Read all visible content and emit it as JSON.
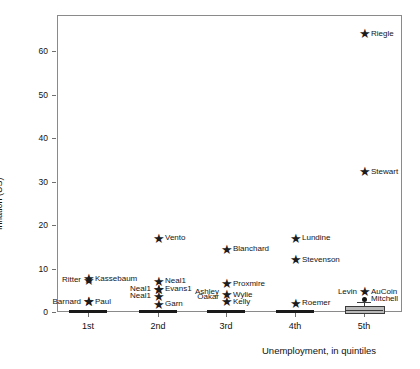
{
  "chart_data": {
    "type": "scatter",
    "title": "",
    "xlabel": "Unemployment, in quintiles",
    "ylabel": "Inflation (US)",
    "categories": [
      "1st",
      "2nd",
      "3rd",
      "4th",
      "5th"
    ],
    "yticks": [
      0,
      10,
      20,
      30,
      40,
      50,
      60
    ],
    "ylim": [
      0,
      68
    ],
    "grid": false,
    "legend": null,
    "points": [
      {
        "label": "Barnard",
        "quintile": "1st",
        "x": 1,
        "y": 2.4,
        "side": "left",
        "marker": "star"
      },
      {
        "label": "Paul",
        "quintile": "1st",
        "x": 1,
        "y": 2.4,
        "side": "right",
        "marker": "star"
      },
      {
        "label": "Ritter",
        "quintile": "1st",
        "x": 1,
        "y": 7.3,
        "side": "left",
        "marker": "star"
      },
      {
        "label": "Kassebaum",
        "quintile": "1st",
        "x": 1,
        "y": 7.6,
        "side": "right",
        "marker": "star"
      },
      {
        "label": "Vento",
        "quintile": "2nd",
        "x": 2,
        "y": 17.0,
        "side": "right",
        "marker": "star"
      },
      {
        "label": "Neal1",
        "quintile": "2nd",
        "x": 2,
        "y": 7.1,
        "side": "right",
        "marker": "star"
      },
      {
        "label": "Neal1",
        "quintile": "2nd",
        "x": 2,
        "y": 5.2,
        "side": "left",
        "marker": "star"
      },
      {
        "label": "Evans1",
        "quintile": "2nd",
        "x": 2,
        "y": 5.2,
        "side": "right",
        "marker": "star"
      },
      {
        "label": "Neal1",
        "quintile": "2nd",
        "x": 2,
        "y": 3.6,
        "side": "left",
        "marker": "star"
      },
      {
        "label": "Garn",
        "quintile": "2nd",
        "x": 2,
        "y": 1.8,
        "side": "right",
        "marker": "star"
      },
      {
        "label": "Blanchard",
        "quintile": "3rd",
        "x": 3,
        "y": 14.4,
        "side": "right",
        "marker": "star"
      },
      {
        "label": "Proxmire",
        "quintile": "3rd",
        "x": 3,
        "y": 6.5,
        "side": "right",
        "marker": "star"
      },
      {
        "label": "Ashley",
        "quintile": "3rd",
        "x": 3,
        "y": 4.6,
        "side": "left",
        "marker": "none"
      },
      {
        "label": "Oakar",
        "quintile": "3rd",
        "x": 3,
        "y": 3.4,
        "side": "left",
        "marker": "none"
      },
      {
        "label": "Wylie",
        "quintile": "3rd",
        "x": 3,
        "y": 4.0,
        "side": "right",
        "marker": "star"
      },
      {
        "label": "Kelly",
        "quintile": "3rd",
        "x": 3,
        "y": 2.3,
        "side": "right",
        "marker": "star"
      },
      {
        "label": "Lundine",
        "quintile": "4th",
        "x": 4,
        "y": 17.0,
        "side": "right",
        "marker": "star"
      },
      {
        "label": "Stevenson",
        "quintile": "4th",
        "x": 4,
        "y": 12.0,
        "side": "right",
        "marker": "star"
      },
      {
        "label": "Roemer",
        "quintile": "4th",
        "x": 4,
        "y": 2.0,
        "side": "right",
        "marker": "star"
      },
      {
        "label": "Riegle",
        "quintile": "5th",
        "x": 5,
        "y": 64.0,
        "side": "right",
        "marker": "star"
      },
      {
        "label": "Stewart",
        "quintile": "5th",
        "x": 5,
        "y": 32.2,
        "side": "right",
        "marker": "star"
      },
      {
        "label": "Levin",
        "quintile": "5th",
        "x": 5,
        "y": 4.6,
        "side": "left",
        "marker": "none"
      },
      {
        "label": "AuCoin",
        "quintile": "5th",
        "x": 5,
        "y": 4.6,
        "side": "right",
        "marker": "star"
      },
      {
        "label": "Mitchell",
        "quintile": "5th",
        "x": 5,
        "y": 2.9,
        "side": "right",
        "marker": "dot"
      }
    ],
    "boxplots": [
      {
        "quintile": "1st",
        "median": 0,
        "q1": 0,
        "q3": 0,
        "degenerate": true
      },
      {
        "quintile": "2nd",
        "median": 0,
        "q1": 0,
        "q3": 0,
        "degenerate": true
      },
      {
        "quintile": "3rd",
        "median": 0,
        "q1": 0,
        "q3": 0,
        "degenerate": true
      },
      {
        "quintile": "4th",
        "median": 0,
        "q1": 0,
        "q3": 0,
        "degenerate": true
      },
      {
        "quintile": "5th",
        "median": 0.4,
        "q1": 0.0,
        "q3": 1.4,
        "whisker_high": 2.4,
        "degenerate": false
      }
    ]
  },
  "axis": {
    "ytick_labels": [
      "0",
      "10",
      "20",
      "30",
      "40",
      "50",
      "60"
    ],
    "xtick_labels": [
      "1st",
      "2nd",
      "3rd",
      "4th",
      "5th"
    ],
    "y_title": "Inflation (US)",
    "x_title": "Unemployment, in quintiles"
  }
}
